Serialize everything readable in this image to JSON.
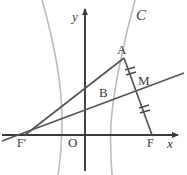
{
  "figure": {
    "kind": "geometry-diagram",
    "colors": {
      "axis": "#3a3a3a",
      "curve": "#b9b9b9",
      "chord": "#5a5a5a",
      "label": "#3a3a3a",
      "background": "#ffffff"
    }
  },
  "labels": {
    "curve_c": "C",
    "point_a": "A",
    "point_b": "B",
    "point_m": "M",
    "origin": "O",
    "focus_right": "F",
    "focus_left": "F′",
    "axis_x": "x",
    "axis_y": "y"
  },
  "geometry": {
    "origin": [
      85,
      135
    ],
    "x_axis": {
      "from": [
        2,
        135
      ],
      "to": [
        181,
        135
      ],
      "arrow": "right"
    },
    "y_axis": {
      "from": [
        85,
        170
      ],
      "to": [
        85,
        5
      ],
      "arrow": "up"
    },
    "points": {
      "A": [
        124,
        58
      ],
      "B": [
        113,
        99
      ],
      "M": [
        135,
        86
      ],
      "F": [
        152,
        135
      ],
      "F_prime": [
        25,
        135
      ]
    },
    "segments": [
      {
        "name": "F-prime-to-A",
        "from": [
          25,
          135
        ],
        "to": [
          124,
          58
        ]
      },
      {
        "name": "A-to-F",
        "from": [
          124,
          58
        ],
        "to": [
          152,
          135
        ]
      },
      {
        "name": "F-prime-through-M",
        "from": [
          2,
          141
        ],
        "to": [
          184,
          73
        ]
      }
    ],
    "tick_marks": [
      {
        "name": "tick-on-AM",
        "at": [
          130,
          73
        ],
        "count": 2
      },
      {
        "name": "tick-on-MF",
        "at": [
          144,
          111
        ],
        "count": 2
      }
    ],
    "curves": [
      {
        "name": "left-branch",
        "path": "M 42 0 C 54 42 62 86 62 120 C 62 144 60 162 58 175"
      },
      {
        "name": "right-branch",
        "path": "M 135 0 C 124 40 113 92 111 124 C 110 146 111 162 112 175"
      }
    ]
  }
}
